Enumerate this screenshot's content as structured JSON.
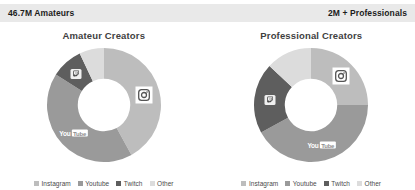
{
  "header": {
    "left_stat": "46.7M Amateurs",
    "right_stat": "2M + Professionals",
    "background": "#e9e9e9"
  },
  "palette": {
    "instagram": "#bdbdbd",
    "youtube": "#9a9a9a",
    "twitch": "#5e5e5e",
    "other": "#dcdcdc",
    "title_color": "#3f3f3f",
    "legend_color": "#4a4a4a",
    "page_background": "#ffffff"
  },
  "legend": {
    "items": [
      {
        "label": "Instagram",
        "color": "#bdbdbd"
      },
      {
        "label": "Youtube",
        "color": "#9a9a9a"
      },
      {
        "label": "Twitch",
        "color": "#5e5e5e"
      },
      {
        "label": "Other",
        "color": "#dcdcdc"
      }
    ]
  },
  "charts": [
    {
      "title": "Amateur Creators",
      "badges": {
        "instagram_label": "Instagram",
        "twitch_label": "Twitch",
        "youtube_you": "You",
        "youtube_tube": "Tube"
      }
    },
    {
      "title": "Professional Creators",
      "badges": {
        "instagram_label": "Instagram",
        "twitch_label": "Twitch",
        "youtube_you": "You",
        "youtube_tube": "Tube"
      }
    }
  ],
  "chart_data": [
    {
      "type": "pie",
      "variant": "donut",
      "title": "Amateur Creators",
      "categories": [
        "Instagram",
        "Youtube",
        "Twitch",
        "Other"
      ],
      "values": [
        42,
        42,
        9,
        7
      ],
      "unit": "percent",
      "colors": [
        "#bdbdbd",
        "#9a9a9a",
        "#5e5e5e",
        "#dcdcdc"
      ],
      "start_angle_deg": 0,
      "direction": "clockwise",
      "inner_radius_ratio": 0.46,
      "legend_position": "bottom",
      "grid": false
    },
    {
      "type": "pie",
      "variant": "donut",
      "title": "Professional Creators",
      "categories": [
        "Instagram",
        "Youtube",
        "Twitch",
        "Other"
      ],
      "values": [
        25,
        42,
        20,
        13
      ],
      "unit": "percent",
      "colors": [
        "#bdbdbd",
        "#9a9a9a",
        "#5e5e5e",
        "#dcdcdc"
      ],
      "start_angle_deg": 0,
      "direction": "clockwise",
      "inner_radius_ratio": 0.46,
      "legend_position": "bottom",
      "grid": false
    }
  ]
}
